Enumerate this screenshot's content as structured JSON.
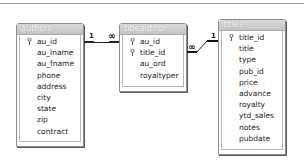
{
  "diagram": {
    "tables": [
      {
        "name": "authors",
        "fields": [
          {
            "name": "au_id",
            "primary_key": true
          },
          {
            "name": "au_lname",
            "primary_key": false
          },
          {
            "name": "au_fname",
            "primary_key": false
          },
          {
            "name": "phone",
            "primary_key": false
          },
          {
            "name": "address",
            "primary_key": false
          },
          {
            "name": "city",
            "primary_key": false
          },
          {
            "name": "state",
            "primary_key": false
          },
          {
            "name": "zip",
            "primary_key": false
          },
          {
            "name": "contract",
            "primary_key": false
          }
        ]
      },
      {
        "name": "titleauthor",
        "fields": [
          {
            "name": "au_id",
            "primary_key": true
          },
          {
            "name": "title_id",
            "primary_key": true
          },
          {
            "name": "au_ord",
            "primary_key": false
          },
          {
            "name": "royaltyper",
            "primary_key": false
          }
        ]
      },
      {
        "name": "titles",
        "fields": [
          {
            "name": "title_id",
            "primary_key": true
          },
          {
            "name": "title",
            "primary_key": false
          },
          {
            "name": "type",
            "primary_key": false
          },
          {
            "name": "pub_id",
            "primary_key": false
          },
          {
            "name": "price",
            "primary_key": false
          },
          {
            "name": "advance",
            "primary_key": false
          },
          {
            "name": "royalty",
            "primary_key": false
          },
          {
            "name": "ytd_sales",
            "primary_key": false
          },
          {
            "name": "notes",
            "primary_key": false
          },
          {
            "name": "pubdate",
            "primary_key": false
          }
        ]
      }
    ],
    "relationships": [
      {
        "from": "authors",
        "to": "titleauthor",
        "from_card": "1",
        "to_card": "∞"
      },
      {
        "from": "titleauthor",
        "to": "titles",
        "from_card": "∞",
        "to_card": "1"
      }
    ]
  }
}
